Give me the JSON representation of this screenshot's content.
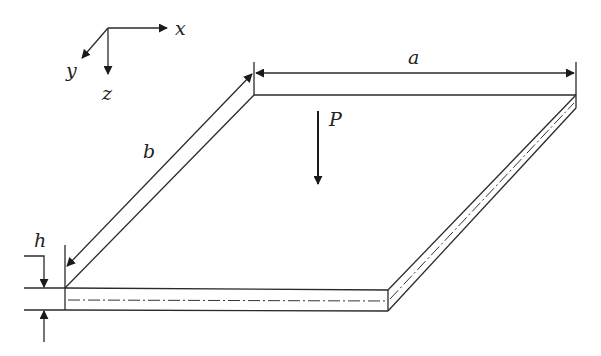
{
  "diagram": {
    "axes": {
      "x_label": "x",
      "y_label": "y",
      "z_label": "z"
    },
    "dimensions": {
      "length_label": "a",
      "width_label": "b",
      "thickness_label": "h"
    },
    "load": {
      "label": "P"
    },
    "colors": {
      "line": "#2a2a2a",
      "background": "#ffffff"
    }
  }
}
